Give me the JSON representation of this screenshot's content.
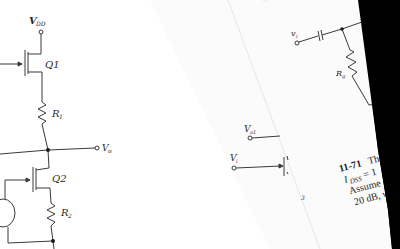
{
  "left_page": {
    "circuit": {
      "supply_label": "V",
      "supply_sub": "DD",
      "transistor_1": "Q1",
      "resistor_1": "R",
      "resistor_1_sub": "1",
      "output_label": "V",
      "output_sub": "o",
      "transistor_2": "Q2",
      "resistor_2": "R",
      "resistor_2_sub": "2"
    }
  },
  "middle_page": {
    "circuit": {
      "input_top_label": "V",
      "input_top_sub": "o1",
      "input_label": "V",
      "input_sub": "i",
      "stray_mark": "3"
    }
  },
  "right_page": {
    "circuit": {
      "input_label": "v",
      "input_sub": "i",
      "gate_resistor": "R",
      "gate_resistor_sub": "g"
    },
    "problem": {
      "number": "11-71",
      "line1_start": "Th",
      "line2": "I",
      "line2_sub": "DSS",
      "line2_rest": " = 1",
      "line3": "Assume",
      "line4": "20 dB, w"
    }
  },
  "colors": {
    "paper": "#ffffff",
    "ink": "#2a2a2a",
    "background_dark": "#000000"
  }
}
